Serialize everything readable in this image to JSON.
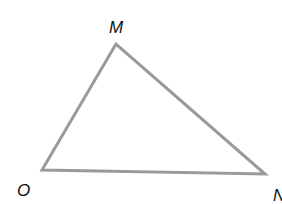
{
  "diagram": {
    "type": "triangle",
    "stroke_color": "#9a9a9a",
    "vertices": [
      {
        "label": "M",
        "x": 116,
        "y": 44
      },
      {
        "label": "O",
        "x": 42,
        "y": 170
      },
      {
        "label": "N",
        "x": 265,
        "y": 174
      }
    ],
    "labels": {
      "M": "M",
      "O": "O",
      "N": "N"
    }
  }
}
